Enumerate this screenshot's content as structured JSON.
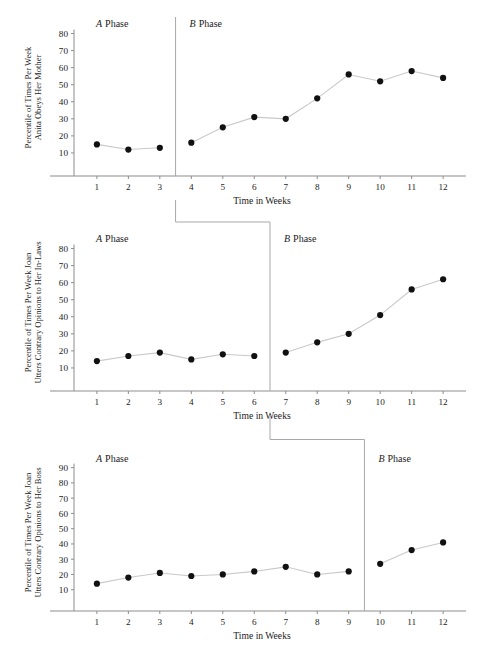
{
  "figure": {
    "background": "#ffffff",
    "dot_color": "#111111",
    "line_color": "#c9c9c9",
    "axis_color": "#8d8d8d",
    "phase_line_color": "#a8a8a8"
  },
  "chart_data": [
    {
      "type": "line",
      "panel": 1,
      "title": "",
      "ylabel": "Percentile of Times Per Week Anita Obeys Her Mother",
      "ylabel_line1": "Percentile of Times Per Week",
      "ylabel_line2": "Anita Obeys Her Mother",
      "xlabel": "Time in Weeks",
      "x": [
        1,
        2,
        3,
        4,
        5,
        6,
        7,
        8,
        9,
        10,
        11,
        12
      ],
      "values": [
        15,
        12,
        13,
        16,
        25,
        31,
        30,
        42,
        56,
        52,
        58,
        54
      ],
      "categories": [
        "1",
        "2",
        "3",
        "4",
        "5",
        "6",
        "7",
        "8",
        "9",
        "10",
        "11",
        "12"
      ],
      "yticks": [
        10,
        20,
        30,
        40,
        50,
        60,
        70,
        80
      ],
      "ylim": [
        0,
        85
      ],
      "xlim": [
        0.4,
        12.6
      ],
      "grid": false,
      "legend": "none",
      "phase_break_after_x": 3,
      "phase_labels": [
        {
          "letter": "A",
          "word": "Phase",
          "segment": "baseline"
        },
        {
          "letter": "B",
          "word": "Phase",
          "segment": "treatment"
        }
      ]
    },
    {
      "type": "line",
      "panel": 2,
      "title": "",
      "ylabel": "Percentile of Times Per Week Joan Utters Contrary Opinions to Her In-Laws",
      "ylabel_line1": "Percentile of Times Per Week Joan",
      "ylabel_line2": "Utters Contrary Opinions to Her In-Laws",
      "xlabel": "Time in Weeks",
      "x": [
        1,
        2,
        3,
        4,
        5,
        6,
        7,
        8,
        9,
        10,
        11,
        12
      ],
      "values": [
        14,
        17,
        19,
        15,
        18,
        17,
        19,
        25,
        30,
        41,
        56,
        62
      ],
      "categories": [
        "1",
        "2",
        "3",
        "4",
        "5",
        "6",
        "7",
        "8",
        "9",
        "10",
        "11",
        "12"
      ],
      "yticks": [
        10,
        20,
        30,
        40,
        50,
        60,
        70,
        80
      ],
      "ylim": [
        0,
        85
      ],
      "xlim": [
        0.4,
        12.6
      ],
      "grid": false,
      "legend": "none",
      "phase_break_after_x": 6,
      "phase_labels": [
        {
          "letter": "A",
          "word": "Phase",
          "segment": "baseline"
        },
        {
          "letter": "B",
          "word": "Phase",
          "segment": "treatment"
        }
      ]
    },
    {
      "type": "line",
      "panel": 3,
      "title": "",
      "ylabel": "Percentile of Times Per Week Joan Utters Contrary Opinions to Her Boss",
      "ylabel_line1": "Percentile of Times Per Week Joan",
      "ylabel_line2": "Utters Contrary Opinions to Her Boss",
      "xlabel": "Time in Weeks",
      "x": [
        1,
        2,
        3,
        4,
        5,
        6,
        7,
        8,
        9,
        10,
        11,
        12
      ],
      "values": [
        14,
        18,
        21,
        19,
        20,
        22,
        25,
        20,
        22,
        27,
        36,
        41
      ],
      "categories": [
        "1",
        "2",
        "3",
        "4",
        "5",
        "6",
        "7",
        "8",
        "9",
        "10",
        "11",
        "12"
      ],
      "yticks": [
        10,
        20,
        30,
        40,
        50,
        60,
        70,
        80,
        90
      ],
      "ylim": [
        0,
        95
      ],
      "xlim": [
        0.4,
        12.6
      ],
      "grid": false,
      "legend": "none",
      "phase_break_after_x": 9,
      "phase_labels": [
        {
          "letter": "A",
          "word": "Phase",
          "segment": "baseline"
        },
        {
          "letter": "B",
          "word": "Phase",
          "segment": "treatment"
        }
      ]
    }
  ]
}
